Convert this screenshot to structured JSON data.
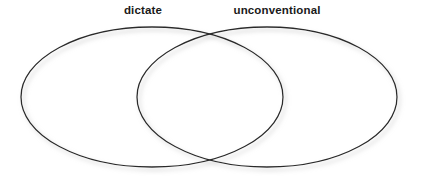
{
  "figure": {
    "type": "venn-diagram",
    "background_color": "#ffffff",
    "stroke_color": "#2b2b2b",
    "stroke_width": 1.3,
    "shadow_color": "#c8c8c8",
    "label_color": "#1a1a1a"
  },
  "labels": {
    "left": "dictate",
    "right": "unconventional"
  },
  "chart_data": {
    "type": "venn",
    "title": "",
    "sets": [
      {
        "name": "dictate",
        "label": "dictate",
        "shape": "ellipse",
        "center_x": 152,
        "center_y": 97,
        "radius_x": 131,
        "radius_y": 70,
        "fill": "none",
        "stroke": "#2b2b2b",
        "label_position": "top-left"
      },
      {
        "name": "unconventional",
        "label": "unconventional",
        "shape": "ellipse",
        "center_x": 267,
        "center_y": 97,
        "radius_x": 130,
        "radius_y": 70,
        "fill": "none",
        "stroke": "#2b2b2b",
        "label_position": "top-right"
      }
    ],
    "intersection": {
      "label": "",
      "top_crossing": {
        "x": 208,
        "y": 32
      },
      "bottom_crossing": {
        "x": 208,
        "y": 162
      }
    },
    "values": [],
    "legend": "none",
    "grid": false,
    "xlabel": "",
    "ylabel": ""
  }
}
